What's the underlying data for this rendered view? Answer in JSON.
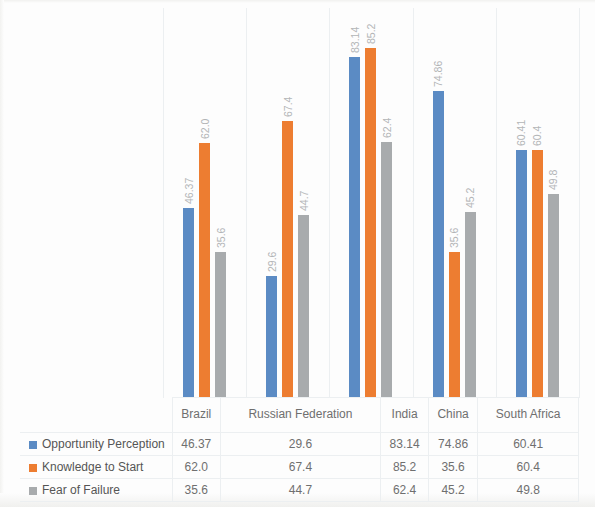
{
  "chart_data": {
    "type": "bar",
    "title": "",
    "subtitle": "",
    "xlabel": "",
    "ylabel": "",
    "ylim": [
      0,
      95
    ],
    "grid": false,
    "legend_position": "bottom-left-table",
    "orientation": "vertical",
    "data_labels": true,
    "data_label_rotation": -90,
    "categories": [
      "Brazil",
      "Russian Federation",
      "India",
      "China",
      "South Africa"
    ],
    "series": [
      {
        "name": "Opportunity Perception",
        "color": "#5b8bc4",
        "values": [
          46.37,
          29.6,
          83.14,
          74.86,
          60.41
        ],
        "labels": [
          "46.37",
          "29.6",
          "83.14",
          "74.86",
          "60.41"
        ]
      },
      {
        "name": "Knowledge to Start",
        "color": "#ed7d31",
        "values": [
          62.0,
          67.4,
          85.2,
          35.6,
          60.4
        ],
        "labels": [
          "62.0",
          "67.4",
          "85.2",
          "35.6",
          "60.4"
        ]
      },
      {
        "name": "Fear of Failure",
        "color": "#a8abad",
        "values": [
          35.6,
          44.7,
          62.4,
          45.2,
          49.8
        ],
        "labels": [
          "35.6",
          "44.7",
          "62.4",
          "45.2",
          "49.8"
        ]
      }
    ]
  },
  "table": {
    "corner_label": "",
    "column_headers": [
      "Brazil",
      "Russian Federation",
      "India",
      "China",
      "South Africa"
    ],
    "rows": [
      {
        "label": "Opportunity Perception",
        "swatch_color": "#5b8bc4",
        "values": [
          "46.37",
          "29.6",
          "83.14",
          "74.86",
          "60.41"
        ]
      },
      {
        "label": "Knowledge to Start",
        "swatch_color": "#ed7d31",
        "values": [
          "62.0",
          "67.4",
          "85.2",
          "35.6",
          "60.4"
        ]
      },
      {
        "label": "Fear of Failure",
        "swatch_color": "#a8abad",
        "values": [
          "35.6",
          "44.7",
          "62.4",
          "45.2",
          "49.8"
        ]
      }
    ]
  },
  "colors": {
    "series_blue": "#5b8bc4",
    "series_orange": "#ed7d31",
    "series_gray": "#a8abad",
    "grid_line": "#eceff1",
    "label_text": "#b3b5b7",
    "table_text": "#6f6f6f",
    "background": "#fdfdfd"
  }
}
